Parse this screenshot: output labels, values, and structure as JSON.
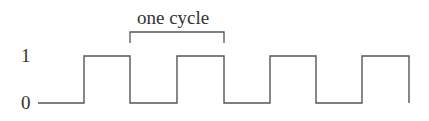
{
  "diagram": {
    "caption": "one cycle",
    "y_labels": {
      "high": "1",
      "low": "0"
    },
    "stroke_color": "#555555",
    "text_color": "#333333",
    "waveform": {
      "type": "square-wave",
      "levels": [
        0,
        1
      ],
      "sequence": [
        0,
        1,
        0,
        1,
        0,
        1,
        0,
        1
      ],
      "cycles_shown": 4
    }
  }
}
